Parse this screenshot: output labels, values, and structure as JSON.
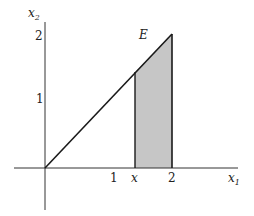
{
  "figure": {
    "region_label": "E",
    "axes": {
      "x_label": "x",
      "x_label_sub": "1",
      "y_label": "x",
      "y_label_sub": "2"
    },
    "x_ticks": [
      "1",
      "x",
      "2"
    ],
    "y_ticks": [
      "1",
      "2"
    ],
    "colors": {
      "line": "#1a1a1a",
      "axis": "#333333",
      "shade": "#c6c6c6"
    },
    "geometry": {
      "line": "x2 = x1 from (0,0) to (2,2)",
      "shaded_strip": "x ≤ x1 ≤ 2, 0 ≤ x2 ≤ x1"
    }
  }
}
